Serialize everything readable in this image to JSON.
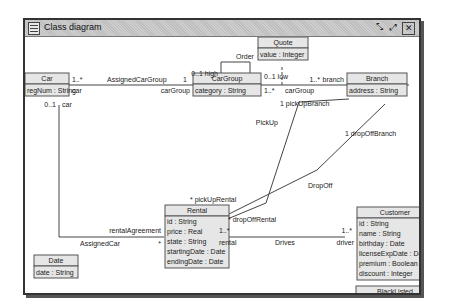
{
  "window": {
    "title": "Class diagram",
    "buttons": {
      "restore": "⤡",
      "maximize": "⤢",
      "close": "✕"
    }
  },
  "classes": {
    "car": {
      "name": "Car",
      "attrs": [
        "regNum : String"
      ]
    },
    "cargroup": {
      "name": "CarGroup",
      "attrs": [
        "category : String"
      ]
    },
    "quote": {
      "name": "Quote",
      "attrs": [
        "value : Integer"
      ]
    },
    "branch": {
      "name": "Branch",
      "attrs": [
        "address : String"
      ]
    },
    "rental": {
      "name": "Rental",
      "attrs": [
        "id : String",
        "price : Real",
        "state : String",
        "startingDate : Date",
        "endingDate : Date"
      ]
    },
    "customer": {
      "name": "Customer",
      "attrs": [
        "id : String",
        "name : String",
        "birthday : Date",
        "licenseExpDate : Date",
        "premium : Boolean",
        "discount : Integer"
      ]
    },
    "blacklisted": {
      "name": "BlackListed",
      "attrs": [
        "blackListedDate : Date"
      ]
    },
    "date": {
      "name": "Date",
      "attrs": [
        "date : String"
      ]
    }
  },
  "labels": {
    "assignedCarGroup": "AssignedCarGroup",
    "car_mult_acg": "1..*",
    "car_role_acg": "car",
    "cg_mult_acg": "1",
    "cg_role_acg": "carGroup",
    "order": "Order",
    "high": "0..1 high",
    "low": "0..1 low",
    "cg_mult_branch": "1..*",
    "cg_role_branch": "carGroup",
    "branch_mult": "1..*",
    "branch_role": "branch",
    "car_mult_assigned": "0..1",
    "car_role_assigned": "car",
    "assignedCar": "AssignedCar",
    "rentalAgreement": "rentalAgreement",
    "rental_star_assigned": "*",
    "pickUpBranch": "1 pickUpBranch",
    "pickUp": "PickUp",
    "pickUpRental": "* pickUpRental",
    "dropOffBranch": "1 dropOffBranch",
    "dropOff": "DropOff",
    "dropOffRental": "* dropOffRental",
    "rental_mult_drives": "1..*",
    "rental_role_drives": "rental",
    "drives": "Drives",
    "driver_mult": "1..*",
    "driver_role": "driver"
  }
}
